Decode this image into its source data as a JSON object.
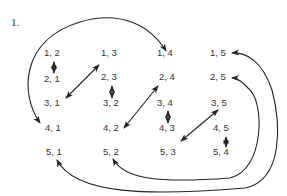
{
  "figure": {
    "number_label": "1.",
    "nodes": [
      {
        "id": "n12",
        "text": "1, 2",
        "x": 17,
        "y": 56
      },
      {
        "id": "n13",
        "text": "1, 3",
        "x": 103,
        "y": 56
      },
      {
        "id": "n14",
        "text": "1, 4",
        "x": 157,
        "y": 56
      },
      {
        "id": "n15",
        "text": "1, 5",
        "x": 211,
        "y": 56
      },
      {
        "id": "n21",
        "text": "2, 1",
        "x": 17,
        "y": 82
      },
      {
        "id": "n23",
        "text": "2, 3",
        "x": 103,
        "y": 80
      },
      {
        "id": "n24",
        "text": "2, 4",
        "x": 157,
        "y": 80
      },
      {
        "id": "n25",
        "text": "2, 5",
        "x": 211,
        "y": 80
      },
      {
        "id": "n31",
        "text": "3, 1",
        "x": 17,
        "y": 106
      },
      {
        "id": "n32",
        "text": "3, 2",
        "x": 103,
        "y": 106
      },
      {
        "id": "n34",
        "text": "3, 4",
        "x": 157,
        "y": 106
      },
      {
        "id": "n35",
        "text": "3, 5",
        "x": 211,
        "y": 106
      },
      {
        "id": "n41",
        "text": "4, 1",
        "x": 17,
        "y": 132
      },
      {
        "id": "n42",
        "text": "4, 2",
        "x": 103,
        "y": 132
      },
      {
        "id": "n43",
        "text": "4, 3",
        "x": 157,
        "y": 132
      },
      {
        "id": "n45",
        "text": "4, 5",
        "x": 211,
        "y": 132
      },
      {
        "id": "n51",
        "text": "5, 1",
        "x": 17,
        "y": 156
      },
      {
        "id": "n52",
        "text": "5, 2",
        "x": 103,
        "y": 156
      },
      {
        "id": "n53",
        "text": "5, 3",
        "x": 157,
        "y": 156
      },
      {
        "id": "n54",
        "text": "5, 4",
        "x": 211,
        "y": 156
      }
    ]
  }
}
